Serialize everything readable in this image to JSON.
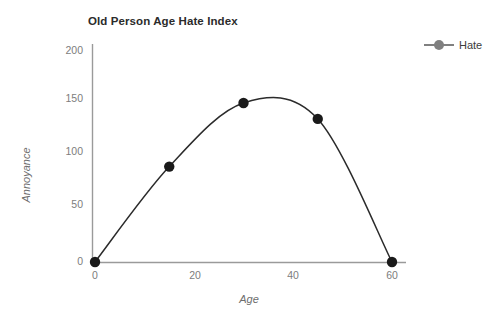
{
  "chart_data": {
    "type": "line",
    "title": "Old Person Age Hate Index",
    "xlabel": "Age",
    "ylabel": "Annoyance",
    "xlim": [
      0,
      60
    ],
    "ylim": [
      0,
      200
    ],
    "xticks": [
      "0",
      "20",
      "40",
      "60"
    ],
    "xtick_values": [
      0,
      20,
      40,
      60
    ],
    "yticks": [
      "0",
      "50",
      "100",
      "150",
      "200"
    ],
    "ytick_values": [
      0,
      50,
      100,
      150,
      200
    ],
    "grid": false,
    "legend_position": "right",
    "smoothed": true,
    "series": [
      {
        "name": "Hate",
        "color": "#808080",
        "marker_color": "#1a1a1a",
        "line_color": "#2b2b2b",
        "x": [
          0,
          15,
          30,
          45,
          60
        ],
        "y": [
          0,
          90,
          150,
          135,
          0
        ]
      }
    ]
  },
  "legend": {
    "items": [
      {
        "label": "Hate",
        "color": "#808080"
      }
    ]
  },
  "axes": {
    "x_title": "Age",
    "y_title": "Annoyance"
  }
}
